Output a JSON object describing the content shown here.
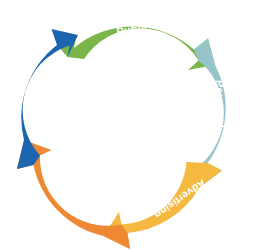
{
  "diagram": {
    "type": "circular-arrow-cycle",
    "background_color": "#ffffff",
    "direction": "clockwise",
    "center_fill": "#ffffff",
    "label_color": "#ffffff",
    "segments": [
      {
        "id": "public-relations",
        "label_lines": [
          "Public",
          "relations"
        ],
        "label": "Public relations",
        "color": "#7AB648",
        "position": "top",
        "start_angle": -72,
        "end_angle": 0,
        "label_rotation": -8
      },
      {
        "id": "personal-selling",
        "label_lines": [
          "Personal",
          "selling"
        ],
        "label": "Personal selling",
        "color": "#95C4C9",
        "position": "right",
        "start_angle": 0,
        "end_angle": 72,
        "label_rotation": 90
      },
      {
        "id": "advertising",
        "label_lines": [
          "Advertising"
        ],
        "label": "Advertising",
        "color": "#F5B942",
        "position": "bottom-right",
        "start_angle": 72,
        "end_angle": 144,
        "label_rotation": 145
      },
      {
        "id": "direct-marketing",
        "label_lines": [
          "Direct",
          "marketing"
        ],
        "label": "Direct marketing",
        "color": "#EE8832",
        "position": "bottom-left",
        "start_angle": 144,
        "end_angle": 216,
        "label_rotation": -145
      },
      {
        "id": "sales-promotion",
        "label_lines": [
          "Sales",
          "promotion"
        ],
        "label": "Sales promotion",
        "color": "#1B66AE",
        "position": "left",
        "start_angle": 216,
        "end_angle": 288,
        "label_rotation": -60
      }
    ]
  }
}
